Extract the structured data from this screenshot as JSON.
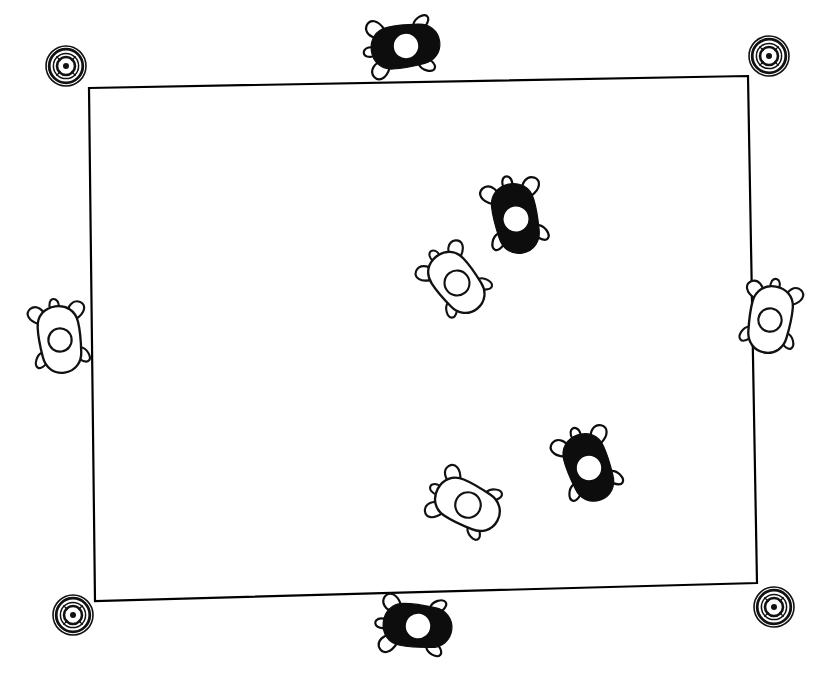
{
  "figure": {
    "width": 835,
    "height": 678,
    "background_color": "#ffffff",
    "ink_color": "#000000"
  },
  "arena": {
    "name": "rectangular-arena",
    "shape": "quadrilateral",
    "stroke_color": "#000000",
    "stroke_width": 2.2,
    "fill": "none",
    "corners": [
      {
        "label": "top-left",
        "x": 89,
        "y": 88
      },
      {
        "label": "top-right",
        "x": 748,
        "y": 76
      },
      {
        "label": "bottom-right",
        "x": 757,
        "y": 583
      },
      {
        "label": "bottom-left",
        "x": 95,
        "y": 601
      }
    ]
  },
  "fiducial_markers": {
    "name": "corner-bullseye-markers",
    "count": 4,
    "ring_count": 4,
    "outer_radius": 20,
    "stroke_color": "#111111",
    "items": [
      {
        "label": "marker-top-left",
        "corner": "top-left",
        "cx": 66,
        "cy": 66,
        "r": 20
      },
      {
        "label": "marker-top-right",
        "corner": "top-right",
        "cx": 769,
        "cy": 56,
        "r": 20
      },
      {
        "label": "marker-bottom-right",
        "corner": "bottom-right",
        "cx": 774,
        "cy": 607,
        "r": 20
      },
      {
        "label": "marker-bottom-left",
        "corner": "bottom-left",
        "cx": 73,
        "cy": 615,
        "r": 20
      }
    ]
  },
  "animals": {
    "name": "tracked-animals",
    "count": 8,
    "filled_count": 4,
    "outline_count": 4,
    "disc_label": "dorsal tracking disc",
    "items": [
      {
        "id": "animal-1",
        "label": "animal-top-edge",
        "coat": "filled",
        "position": "outside-top-edge",
        "cx": 406,
        "cy": 46,
        "rotation": 82,
        "scale": 1.0,
        "disc_radius": 13
      },
      {
        "id": "animal-2",
        "label": "animal-upper-right-interior",
        "coat": "filled",
        "position": "inside-arena",
        "cx": 516,
        "cy": 219,
        "rotation": 168,
        "scale": 1.02,
        "disc_radius": 13
      },
      {
        "id": "animal-3",
        "label": "animal-upper-center-interior",
        "coat": "outline",
        "position": "inside-arena",
        "cx": 457,
        "cy": 283,
        "rotation": 142,
        "scale": 0.96,
        "disc_radius": 13
      },
      {
        "id": "animal-4",
        "label": "animal-left-edge",
        "coat": "outline",
        "position": "outside-left-edge",
        "cx": 60,
        "cy": 340,
        "rotation": 172,
        "scale": 0.97,
        "disc_radius": 12
      },
      {
        "id": "animal-5",
        "label": "animal-right-edge",
        "coat": "outline",
        "position": "outside-right-edge",
        "cx": 770,
        "cy": 320,
        "rotation": 190,
        "scale": 0.97,
        "disc_radius": 12
      },
      {
        "id": "animal-6",
        "label": "animal-lower-right-interior",
        "coat": "filled",
        "position": "inside-arena",
        "cx": 589,
        "cy": 468,
        "rotation": 160,
        "scale": 1.0,
        "disc_radius": 13
      },
      {
        "id": "animal-7",
        "label": "animal-lower-center-interior",
        "coat": "outline",
        "position": "inside-arena",
        "cx": 468,
        "cy": 505,
        "rotation": 118,
        "scale": 0.98,
        "disc_radius": 13
      },
      {
        "id": "animal-8",
        "label": "animal-bottom-edge",
        "coat": "filled",
        "position": "outside-bottom-edge",
        "cx": 418,
        "cy": 626,
        "rotation": 96,
        "scale": 1.0,
        "disc_radius": 13
      }
    ]
  }
}
